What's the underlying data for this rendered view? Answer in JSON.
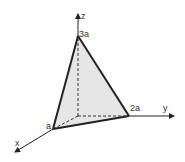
{
  "diagram": {
    "type": "3D coordinate diagram — tetrahedron with intercepts",
    "axes": {
      "x": "x",
      "y": "y",
      "z": "z"
    },
    "vertices": {
      "x_intercept": "a",
      "y_intercept": "2a",
      "z_intercept": "3a"
    },
    "colors": {
      "face_fill": "#e6e6e6",
      "line": "#222222"
    }
  }
}
